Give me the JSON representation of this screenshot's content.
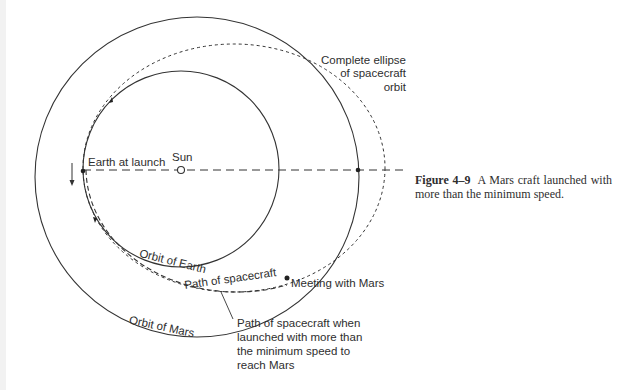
{
  "figure": {
    "number": "Figure 4–9",
    "caption": "A Mars craft launched with more than the minimum speed."
  },
  "labels": {
    "complete_ellipse": [
      "Complete ellipse",
      "of spacecraft",
      "orbit"
    ],
    "earth_at_launch": "Earth at launch",
    "sun": "Sun",
    "orbit_of_earth": "Orbit of Earth",
    "path_of_spacecraft": "Path of spacecraft",
    "meeting_with_mars": "Meeting with Mars",
    "orbit_of_mars": "Orbit of Mars",
    "path_note": [
      "Path of spacecraft when",
      "launched with more than",
      "the minimum speed to",
      "reach Mars"
    ]
  },
  "geometry": {
    "sun": {
      "x": 181,
      "y": 170
    },
    "earth_orbit": {
      "cx": 181,
      "cy": 169,
      "r": 98
    },
    "mars_orbit": {
      "cx": 197,
      "cy": 177,
      "rx": 162,
      "ry": 160
    },
    "spacecraft_ellipse": {
      "cx": 234,
      "cy": 168,
      "rx": 151,
      "ry": 124
    },
    "sun_earth_axis_y": 170
  },
  "colors": {
    "line": "#333333",
    "text": "#2e2e2e",
    "background": "#ffffff"
  }
}
